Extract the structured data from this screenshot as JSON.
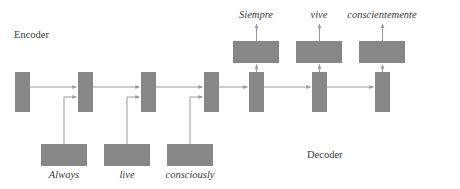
{
  "diagram": {
    "title_encoder": "Encoder",
    "title_decoder": "Decoder",
    "colors": {
      "block": "#878787",
      "wire": "#9a9a9a",
      "text": "#3a3a3a",
      "background": "#ffffff"
    },
    "source_tokens": [
      {
        "text": "Always",
        "cx": 64
      },
      {
        "text": "live",
        "cx": 127
      },
      {
        "text": "consciously",
        "cx": 190
      }
    ],
    "target_tokens": [
      {
        "text": "Siempre",
        "cx": 256
      },
      {
        "text": "vive",
        "cx": 319
      },
      {
        "text": "conscientemente",
        "cx": 382
      }
    ],
    "encoder_cells": [
      {
        "x": 15,
        "y": 72
      },
      {
        "x": 78,
        "y": 72
      },
      {
        "x": 141,
        "y": 72
      },
      {
        "x": 204,
        "y": 72
      }
    ],
    "decoder_cells": [
      {
        "x": 249,
        "y": 72
      },
      {
        "x": 312,
        "y": 72
      },
      {
        "x": 375,
        "y": 72
      }
    ],
    "input_blocks": [
      {
        "x": 41,
        "y": 144
      },
      {
        "x": 104,
        "y": 144
      },
      {
        "x": 167,
        "y": 144
      }
    ],
    "output_blocks": [
      {
        "x": 233,
        "y": 41
      },
      {
        "x": 296,
        "y": 41
      },
      {
        "x": 359,
        "y": 41
      }
    ],
    "encoder_label": {
      "x": 14,
      "y": 30
    },
    "decoder_label": {
      "x": 307,
      "y": 150
    }
  }
}
